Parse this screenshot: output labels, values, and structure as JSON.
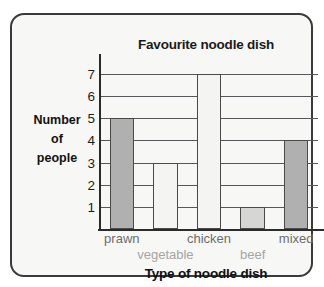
{
  "frame": {
    "background": "#f7f7f5",
    "border_color": "#3a3a3a"
  },
  "chart_data": {
    "type": "bar",
    "title": "Favourite noodle dish",
    "xlabel": "Type of noodle dish",
    "ylabel": "Number of people",
    "ylabel_lines": [
      "Number",
      "of",
      "people"
    ],
    "categories": [
      "prawn",
      "vegetable",
      "chicken",
      "beef",
      "mixed"
    ],
    "values": [
      5,
      3,
      7,
      1,
      4
    ],
    "ylim": [
      0,
      7.5
    ],
    "yticks": [
      7,
      6,
      5,
      4,
      3,
      2,
      1
    ],
    "ytick_labels": [
      "7",
      "6",
      "5",
      "4",
      "3",
      "2",
      "1"
    ],
    "grid": true,
    "legend": false,
    "bar_colors": [
      "#b0b0b0",
      "#f4f4f2",
      "#f4f4f2",
      "#d6d6d4",
      "#b0b0b0"
    ],
    "bar_edge_color": "#4a4a4a",
    "category_label_rows": [
      0,
      1,
      0,
      1,
      0
    ],
    "category_label_colors": [
      "#6d6d6d",
      "#a5a5a5",
      "#6d6d6d",
      "#a5a5a5",
      "#6d6d6d"
    ]
  }
}
